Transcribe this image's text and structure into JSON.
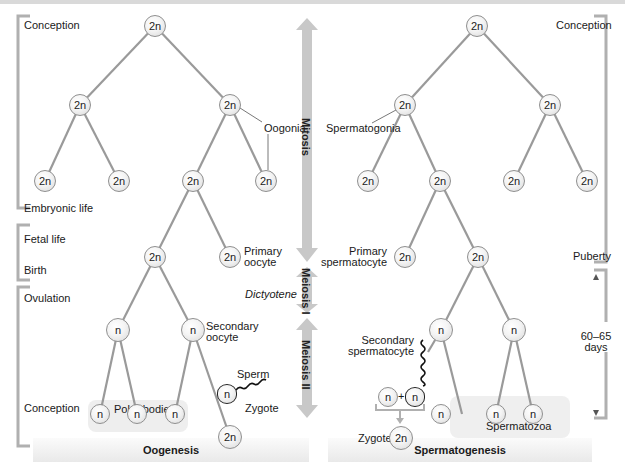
{
  "diagram": {
    "type": "comparison-lineage",
    "title_left": "Oogenesis",
    "title_right": "Spermatogenesis",
    "colors": {
      "line": "#9a9a9a",
      "arrow": "#c8c8c8",
      "bracket": "#b0b0b0",
      "node_border": "#8f8f8f"
    }
  },
  "phases": {
    "mitosis": "Mitosis",
    "meiosis1": "Meiosis I",
    "meiosis2": "Meiosis II",
    "dictyotene": "Dictyotene"
  },
  "oogenesis": {
    "timeline": {
      "conception_top": "Conception",
      "embryonic": "Embryonic life",
      "fetal": "Fetal life",
      "birth": "Birth",
      "ovulation": "Ovulation",
      "conception_bottom": "Conception"
    },
    "labels": {
      "oogonia": "Oogonia",
      "primary_oocyte_1": "Primary",
      "primary_oocyte_2": "oocyte",
      "secondary_oocyte_1": "Secondary",
      "secondary_oocyte_2": "oocyte",
      "sperm": "Sperm",
      "polar_bodies": "Polar bodies",
      "zygote": "Zygote"
    },
    "nodes": [
      {
        "id": "root",
        "x": 155,
        "y": 26,
        "label": "2n"
      },
      {
        "id": "l1a",
        "x": 80,
        "y": 105,
        "label": "2n"
      },
      {
        "id": "l1b",
        "x": 230,
        "y": 105,
        "label": "2n"
      },
      {
        "id": "l2a",
        "x": 45,
        "y": 181,
        "label": "2n"
      },
      {
        "id": "l2b",
        "x": 119,
        "y": 181,
        "label": "2n"
      },
      {
        "id": "l2c",
        "x": 193,
        "y": 181,
        "label": "2n"
      },
      {
        "id": "l2d",
        "x": 266,
        "y": 181,
        "label": "2n"
      },
      {
        "id": "l3a",
        "x": 155,
        "y": 257,
        "label": "2n"
      },
      {
        "id": "l3b",
        "x": 230,
        "y": 257,
        "label": "2n"
      },
      {
        "id": "l4a",
        "x": 118,
        "y": 330,
        "label": "n"
      },
      {
        "id": "l4b",
        "x": 193,
        "y": 330,
        "label": "n"
      },
      {
        "id": "l5a",
        "x": 100,
        "y": 414,
        "label": "n"
      },
      {
        "id": "l5b",
        "x": 137,
        "y": 414,
        "label": "n"
      },
      {
        "id": "l5c",
        "x": 175,
        "y": 414,
        "label": "n"
      },
      {
        "id": "zyg",
        "x": 230,
        "y": 437,
        "label": "2n"
      },
      {
        "id": "sperm",
        "x": 227,
        "y": 394,
        "label": "n"
      }
    ]
  },
  "spermatogenesis": {
    "timeline": {
      "conception": "Conception",
      "puberty": "Puberty",
      "duration_1": "60–65",
      "duration_2": "days"
    },
    "labels": {
      "spermatogonia": "Spermatogonia",
      "primary_1": "Primary",
      "primary_2": "spermatocyte",
      "secondary_1": "Secondary",
      "secondary_2": "spermatocyte",
      "plus": "+",
      "zygote": "Zygote",
      "spermatozoa": "Spermatozoa"
    },
    "nodes": [
      {
        "id": "root",
        "x": 477,
        "y": 26,
        "label": "2n"
      },
      {
        "id": "l1a",
        "x": 405,
        "y": 105,
        "label": "2n"
      },
      {
        "id": "l1b",
        "x": 550,
        "y": 105,
        "label": "2n"
      },
      {
        "id": "l2a",
        "x": 368,
        "y": 181,
        "label": "2n"
      },
      {
        "id": "l2b",
        "x": 440,
        "y": 181,
        "label": "2n"
      },
      {
        "id": "l2c",
        "x": 514,
        "y": 181,
        "label": "2n"
      },
      {
        "id": "l2d",
        "x": 587,
        "y": 181,
        "label": "2n"
      },
      {
        "id": "l3a",
        "x": 405,
        "y": 257,
        "label": "2n"
      },
      {
        "id": "l3b",
        "x": 478,
        "y": 257,
        "label": "2n"
      },
      {
        "id": "l4a",
        "x": 441,
        "y": 330,
        "label": "n"
      },
      {
        "id": "l4b",
        "x": 514,
        "y": 330,
        "label": "n"
      },
      {
        "id": "l5a",
        "x": 441,
        "y": 414,
        "label": "n"
      },
      {
        "id": "l5b",
        "x": 496,
        "y": 414,
        "label": "n"
      },
      {
        "id": "l5c",
        "x": 533,
        "y": 414,
        "label": "n"
      },
      {
        "id": "egg",
        "x": 388,
        "y": 397,
        "label": "n"
      },
      {
        "id": "sp",
        "x": 415,
        "y": 397,
        "label": "n"
      },
      {
        "id": "zyg",
        "x": 401,
        "y": 438,
        "label": "2n"
      }
    ]
  }
}
